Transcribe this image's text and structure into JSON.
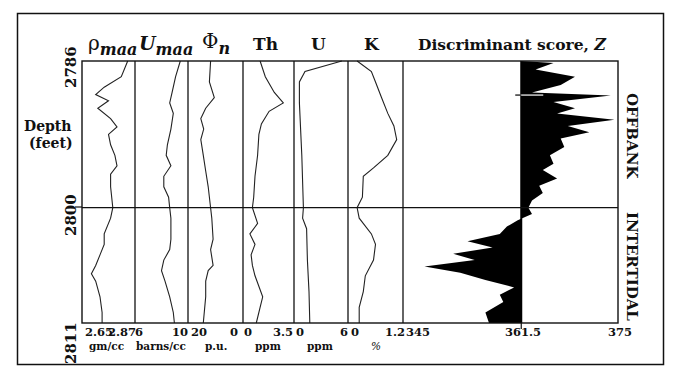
{
  "chart_data": {
    "type": "line",
    "layout": "multi-track well log (depth on vertical axis, increasing downward)",
    "depth_axis": {
      "label_line1": "Depth",
      "label_line2": "(feet)",
      "ticks": [
        "2786",
        "2800",
        "2811"
      ],
      "range": [
        2786,
        2811
      ]
    },
    "tracks": [
      {
        "name": "rho_maa",
        "header_main": "ρ",
        "header_sub": "maa",
        "min": "2.65",
        "max": "2.87",
        "unit": "gm/cc"
      },
      {
        "name": "U_maa",
        "header_main": "U",
        "header_sub": "maa",
        "min": "6",
        "max": "10",
        "unit": "barns/cc"
      },
      {
        "name": "Phi_n",
        "header_main": "Φ",
        "header_sub": "n",
        "min": "20",
        "max": "0",
        "unit": "p.u."
      },
      {
        "name": "Th",
        "header_main": "Th",
        "header_sub": "",
        "min": "0",
        "max": "3.5",
        "unit": "ppm"
      },
      {
        "name": "U",
        "header_main": "U",
        "header_sub": "",
        "min": "0",
        "max": "6",
        "unit": "ppm"
      },
      {
        "name": "K",
        "header_main": "K",
        "header_sub": "",
        "min": "0",
        "max": "1.2",
        "unit": "%"
      }
    ],
    "discriminant": {
      "title": "Discriminant score, ",
      "title_var": "Z",
      "min": "345",
      "baseline": "361.5",
      "max": "375",
      "type": "area",
      "zone_labels": [
        "OFFBANK",
        "INTERTIDAL"
      ],
      "boundary_depth": 2800
    },
    "series": {
      "rho_maa": [
        [
          2786,
          2.85
        ],
        [
          2787.5,
          2.82
        ],
        [
          2788.5,
          2.74
        ],
        [
          2789.2,
          2.7
        ],
        [
          2789.8,
          2.76
        ],
        [
          2790.5,
          2.71
        ],
        [
          2791.5,
          2.77
        ],
        [
          2792.3,
          2.8
        ],
        [
          2793,
          2.76
        ],
        [
          2794,
          2.77
        ],
        [
          2795,
          2.79
        ],
        [
          2796,
          2.8
        ],
        [
          2796.8,
          2.77
        ],
        [
          2798,
          2.77
        ],
        [
          2800,
          2.78
        ],
        [
          2801,
          2.77
        ],
        [
          2802.5,
          2.74
        ],
        [
          2803.5,
          2.74
        ],
        [
          2804.5,
          2.72
        ],
        [
          2805.5,
          2.7
        ],
        [
          2806.3,
          2.68
        ],
        [
          2807,
          2.7
        ],
        [
          2808.5,
          2.72
        ],
        [
          2810,
          2.73
        ],
        [
          2811,
          2.73
        ]
      ],
      "U_maa": [
        [
          2786,
          9.6
        ],
        [
          2787.5,
          9.2
        ],
        [
          2789,
          8.9
        ],
        [
          2790,
          8.7
        ],
        [
          2791,
          9.0
        ],
        [
          2792.5,
          8.8
        ],
        [
          2794,
          8.5
        ],
        [
          2795,
          8.4
        ],
        [
          2796,
          8.8
        ],
        [
          2797,
          8.2
        ],
        [
          2798,
          8.2
        ],
        [
          2799,
          8.6
        ],
        [
          2800,
          8.7
        ],
        [
          2801,
          8.8
        ],
        [
          2803,
          8.8
        ],
        [
          2804,
          8.7
        ],
        [
          2805,
          8.2
        ],
        [
          2806,
          8.0
        ],
        [
          2807,
          8.3
        ],
        [
          2808.5,
          8.7
        ],
        [
          2810,
          9.0
        ],
        [
          2811,
          9.1
        ]
      ],
      "Phi_n": [
        [
          2786,
          12.0
        ],
        [
          2788,
          12.5
        ],
        [
          2789.5,
          10.5
        ],
        [
          2790.5,
          14.0
        ],
        [
          2791.5,
          16.0
        ],
        [
          2792.5,
          14.8
        ],
        [
          2793.5,
          16.0
        ],
        [
          2795,
          15.0
        ],
        [
          2796.5,
          14.0
        ],
        [
          2798,
          13.0
        ],
        [
          2800,
          12.0
        ],
        [
          2801,
          11.5
        ],
        [
          2803,
          11.0
        ],
        [
          2804,
          12.0
        ],
        [
          2805.5,
          11.0
        ],
        [
          2806,
          13.0
        ],
        [
          2807,
          14.0
        ],
        [
          2808.5,
          14.0
        ],
        [
          2811,
          15.0
        ]
      ],
      "Th": [
        [
          2786,
          1.1
        ],
        [
          2787.5,
          1.5
        ],
        [
          2789,
          2.2
        ],
        [
          2790,
          2.9
        ],
        [
          2790.8,
          1.8
        ],
        [
          2792,
          1.2
        ],
        [
          2793,
          1.0
        ],
        [
          2795,
          0.9
        ],
        [
          2797,
          0.7
        ],
        [
          2799,
          0.6
        ],
        [
          2800,
          0.5
        ],
        [
          2801.5,
          0.9
        ],
        [
          2802.5,
          0.3
        ],
        [
          2803.5,
          0.7
        ],
        [
          2804.5,
          0.4
        ],
        [
          2805.5,
          0.5
        ],
        [
          2806.5,
          0.7
        ],
        [
          2808.5,
          1.3
        ],
        [
          2809.5,
          1.1
        ],
        [
          2811,
          0.8
        ]
      ],
      "U": [
        [
          2786,
          5.6
        ],
        [
          2787,
          1.0
        ],
        [
          2788,
          0.3
        ],
        [
          2790,
          0.3
        ],
        [
          2795,
          0.6
        ],
        [
          2800,
          0.8
        ],
        [
          2801,
          0.7
        ],
        [
          2802,
          1.2
        ],
        [
          2805,
          1.3
        ],
        [
          2808,
          1.5
        ],
        [
          2811,
          1.6
        ]
      ],
      "K": [
        [
          2786,
          0.15
        ],
        [
          2787,
          0.5
        ],
        [
          2788,
          0.6
        ],
        [
          2789.5,
          0.75
        ],
        [
          2791,
          0.9
        ],
        [
          2792.2,
          1.05
        ],
        [
          2793.5,
          1.12
        ],
        [
          2795,
          0.9
        ],
        [
          2796.2,
          0.55
        ],
        [
          2797,
          0.3
        ],
        [
          2799,
          0.28
        ],
        [
          2800,
          0.15
        ],
        [
          2801,
          0.2
        ],
        [
          2802.5,
          0.5
        ],
        [
          2803.5,
          0.6
        ],
        [
          2805,
          0.55
        ],
        [
          2806.5,
          0.35
        ],
        [
          2808,
          0.3
        ],
        [
          2809.5,
          0.2
        ],
        [
          2811,
          0.2
        ]
      ],
      "Z": [
        [
          2786,
          361.5
        ],
        [
          2786.2,
          366.0
        ],
        [
          2786.8,
          363.5
        ],
        [
          2787.5,
          369.0
        ],
        [
          2788.3,
          367.0
        ],
        [
          2789.0,
          363.0
        ],
        [
          2789.3,
          374.0
        ],
        [
          2789.9,
          366.0
        ],
        [
          2790.5,
          369.0
        ],
        [
          2791.0,
          366.5
        ],
        [
          2791.6,
          374.5
        ],
        [
          2792.2,
          368.0
        ],
        [
          2792.8,
          371.0
        ],
        [
          2793.4,
          367.0
        ],
        [
          2794.2,
          367.5
        ],
        [
          2795.0,
          365.5
        ],
        [
          2795.8,
          366.0
        ],
        [
          2796.4,
          364.5
        ],
        [
          2797.2,
          366.5
        ],
        [
          2797.9,
          364.0
        ],
        [
          2798.6,
          364.5
        ],
        [
          2799.3,
          363.0
        ],
        [
          2800.0,
          362.5
        ],
        [
          2800.6,
          363.0
        ],
        [
          2801.2,
          361.0
        ],
        [
          2801.8,
          359.5
        ],
        [
          2802.5,
          358.5
        ],
        [
          2803.2,
          354.0
        ],
        [
          2803.8,
          357.5
        ],
        [
          2804.4,
          352.0
        ],
        [
          2805.0,
          355.0
        ],
        [
          2805.6,
          348.0
        ],
        [
          2806.2,
          353.0
        ],
        [
          2806.9,
          356.5
        ],
        [
          2807.6,
          360.5
        ],
        [
          2808.3,
          358.5
        ],
        [
          2809.0,
          359.0
        ],
        [
          2810.0,
          356.5
        ],
        [
          2811.0,
          357.0
        ]
      ]
    }
  },
  "figure": {
    "frame_color": "#111111",
    "fill_color": "#000000",
    "background": "#ffffff"
  }
}
